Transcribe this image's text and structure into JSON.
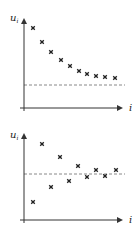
{
  "chart_data": [
    {
      "type": "scatter",
      "title": "",
      "ylabel": "u",
      "ylabel_subscript": "i",
      "xlabel": "i",
      "grid": false,
      "legend": null,
      "reference_line": {
        "style": "dashed",
        "y": 0.25,
        "label": ""
      },
      "x": [
        1,
        2,
        3,
        4,
        5,
        6,
        7,
        8,
        9,
        10
      ],
      "values": [
        0.88,
        0.73,
        0.62,
        0.53,
        0.46,
        0.41,
        0.37,
        0.35,
        0.34,
        0.33
      ],
      "ylim": [
        0,
        1
      ],
      "description": "Monotonically decreasing sequence converging toward the dashed asymptote"
    },
    {
      "type": "scatter",
      "title": "",
      "ylabel": "u",
      "ylabel_subscript": "i",
      "xlabel": "i",
      "grid": false,
      "legend": null,
      "reference_line": {
        "style": "dashed",
        "y": 0.55,
        "label": ""
      },
      "x": [
        1,
        2,
        3,
        4,
        5,
        6,
        7,
        8,
        9,
        10
      ],
      "values": [
        0.21,
        0.88,
        0.38,
        0.72,
        0.45,
        0.62,
        0.5,
        0.58,
        0.52,
        0.58
      ],
      "ylim": [
        0,
        1
      ],
      "description": "Oscillating sequence converging toward the dashed line"
    }
  ],
  "plots": [
    {
      "y_label": "u",
      "y_label_sub": "i",
      "x_label": "i",
      "axis_color": "#333333",
      "marker_color": "#222222",
      "dash_color": "#888888",
      "dashed_y_px": 85,
      "points_px": [
        [
          33,
          28
        ],
        [
          42,
          42
        ],
        [
          51,
          52
        ],
        [
          61,
          60
        ],
        [
          70,
          66
        ],
        [
          79,
          71
        ],
        [
          87,
          74
        ],
        [
          96,
          76
        ],
        [
          105,
          77
        ],
        [
          115,
          78
        ]
      ]
    },
    {
      "y_label": "u",
      "y_label_sub": "i",
      "x_label": "i",
      "axis_color": "#333333",
      "marker_color": "#222222",
      "dash_color": "#888888",
      "dashed_y_px": 56,
      "points_px": [
        [
          33,
          84
        ],
        [
          42,
          26
        ],
        [
          51,
          69
        ],
        [
          60,
          39
        ],
        [
          69,
          63
        ],
        [
          78,
          48
        ],
        [
          87,
          59
        ],
        [
          96,
          52
        ],
        [
          105,
          58
        ],
        [
          116,
          52
        ]
      ]
    }
  ]
}
